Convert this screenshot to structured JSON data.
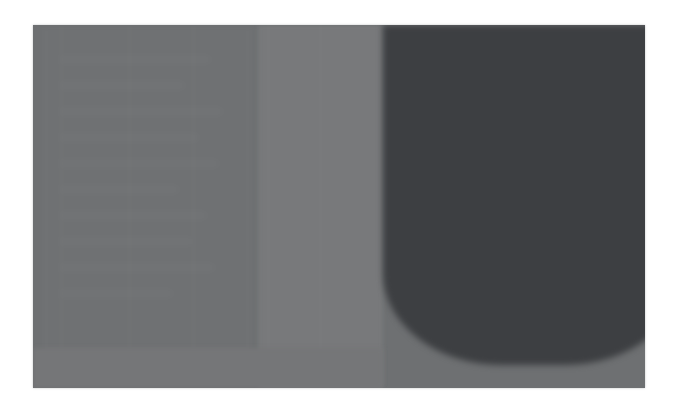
{
  "capture": {
    "width": 675,
    "height": 409,
    "page_background": "#ffffff",
    "focus_state": "out-of-focus",
    "legible_text": "none",
    "description": "Heavily defocused screenshot of an application window: grey sidebar at left, lighter grey content band in the middle, large dark panel at right ending in a wide rounded U shape, and a light grey status strip across the bottom."
  },
  "window": {
    "left": 33,
    "top": 25,
    "width": 612,
    "height": 363,
    "background": "#6e7072"
  },
  "palette": {
    "page": "#ffffff",
    "sidebar": "#6e7072",
    "content_band": "#78797b",
    "dark_panel": "#3d3f42",
    "status_strip": "#757678"
  },
  "sidebar": {
    "label": "sidebar",
    "left": 0,
    "top": 0,
    "width": 225,
    "height": 363,
    "color": "#6e7072",
    "card": {
      "label": "sidebar card",
      "left": 12,
      "top": 4,
      "width": 202,
      "height": 319
    },
    "items": [
      {
        "label": "",
        "top": 26
      },
      {
        "label": "",
        "top": 52
      },
      {
        "label": "",
        "top": 78
      },
      {
        "label": "",
        "top": 104
      },
      {
        "label": "",
        "top": 130
      },
      {
        "label": "",
        "top": 156
      },
      {
        "label": "",
        "top": 182
      },
      {
        "label": "",
        "top": 208
      },
      {
        "label": "",
        "top": 234
      },
      {
        "label": "",
        "top": 260
      }
    ]
  },
  "content": {
    "label": "content band",
    "left": 225,
    "top": 0,
    "width": 125,
    "height": 363,
    "color": "#78797b",
    "body_text": ""
  },
  "dark_panel": {
    "label": "dark panel",
    "left": 350,
    "top": 0,
    "width": 262,
    "height": 340,
    "color": "#3d3f42",
    "shape": "rounded-bottom",
    "corner_radius_x": 118,
    "corner_radius_y": 92,
    "heading": ""
  },
  "status_strip": {
    "label": "status strip",
    "height": 40,
    "color": "#757678",
    "text": ""
  }
}
